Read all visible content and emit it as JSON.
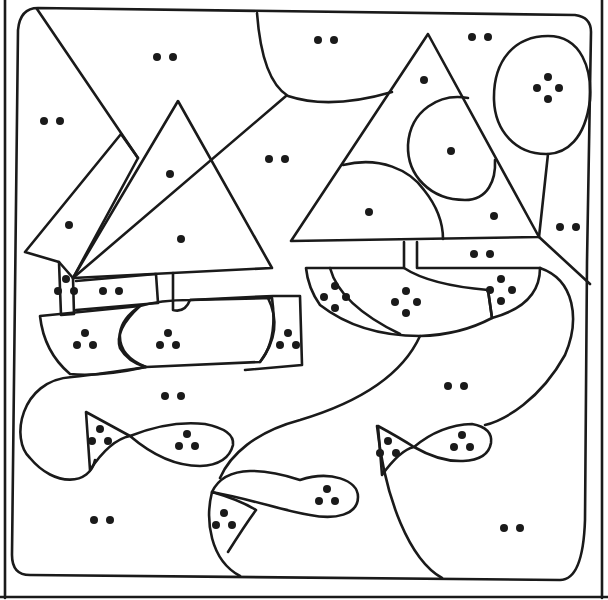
{
  "colors": {
    "ink": "#1a1a1a",
    "paper": "#ffffff"
  },
  "dot_regions": [
    {
      "id": "sky-top-left",
      "x": 165,
      "y": 57,
      "count": 2
    },
    {
      "id": "sky-left",
      "x": 52,
      "y": 121,
      "count": 2
    },
    {
      "id": "sky-top-center",
      "x": 326,
      "y": 40,
      "count": 2
    },
    {
      "id": "sky-top-right",
      "x": 480,
      "y": 37,
      "count": 2
    },
    {
      "id": "sky-middle",
      "x": 277,
      "y": 159,
      "count": 2
    },
    {
      "id": "left-sail-back",
      "x": 69,
      "y": 225,
      "count": 1
    },
    {
      "id": "left-sail-front-upper",
      "x": 170,
      "y": 174,
      "count": 1
    },
    {
      "id": "left-sail-front-lower",
      "x": 181,
      "y": 239,
      "count": 1
    },
    {
      "id": "right-sail-top",
      "x": 424,
      "y": 80,
      "count": 1
    },
    {
      "id": "right-sail-blob",
      "x": 451,
      "y": 151,
      "count": 1
    },
    {
      "id": "right-sail-dome",
      "x": 369,
      "y": 212,
      "count": 1
    },
    {
      "id": "right-sail-corner",
      "x": 494,
      "y": 216,
      "count": 1
    },
    {
      "id": "tree-crown",
      "x": 548,
      "y": 88,
      "count": 4
    },
    {
      "id": "right-edge",
      "x": 568,
      "y": 227,
      "count": 2
    },
    {
      "id": "right-deck",
      "x": 482,
      "y": 254,
      "count": 2
    },
    {
      "id": "left-mast-column",
      "x": 66,
      "y": 286,
      "count": 3
    },
    {
      "id": "left-deck",
      "x": 111,
      "y": 291,
      "count": 2
    },
    {
      "id": "left-hull-front",
      "x": 85,
      "y": 340,
      "count": 3
    },
    {
      "id": "left-hull-middle",
      "x": 168,
      "y": 340,
      "count": 3
    },
    {
      "id": "left-hull-back",
      "x": 288,
      "y": 340,
      "count": 3
    },
    {
      "id": "right-hull-stripe",
      "x": 335,
      "y": 297,
      "count": 4
    },
    {
      "id": "right-hull-middle",
      "x": 406,
      "y": 302,
      "count": 4
    },
    {
      "id": "right-hull-back",
      "x": 501,
      "y": 290,
      "count": 4
    },
    {
      "id": "water-center-left",
      "x": 173,
      "y": 396,
      "count": 2
    },
    {
      "id": "water-right",
      "x": 456,
      "y": 386,
      "count": 2
    },
    {
      "id": "left-fish-tail",
      "x": 100,
      "y": 436,
      "count": 3
    },
    {
      "id": "left-fish-body",
      "x": 187,
      "y": 441,
      "count": 3
    },
    {
      "id": "right-fish-tail",
      "x": 388,
      "y": 448,
      "count": 3
    },
    {
      "id": "right-fish-body",
      "x": 462,
      "y": 442,
      "count": 3
    },
    {
      "id": "water-bottom-left",
      "x": 102,
      "y": 520,
      "count": 2
    },
    {
      "id": "bottom-fish-tail",
      "x": 224,
      "y": 520,
      "count": 3
    },
    {
      "id": "bottom-fish-body",
      "x": 327,
      "y": 496,
      "count": 3
    },
    {
      "id": "water-bottom-right",
      "x": 512,
      "y": 528,
      "count": 2
    }
  ]
}
